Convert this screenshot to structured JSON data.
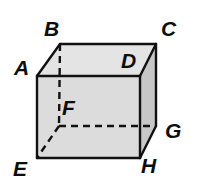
{
  "figure": {
    "kind": "geometry-diagram",
    "shape_name": "cube",
    "background_color": "#ffffff",
    "stroke_color": "#111111",
    "label_color": "#0d0d0d"
  },
  "faces": {
    "front": {
      "name": "front-face",
      "fill": "#dcdcdc",
      "vertices": "A D H E"
    },
    "top": {
      "name": "top-face",
      "fill": "#e4e4e4",
      "vertices": "B C D A"
    },
    "right": {
      "name": "right-face",
      "fill": "#c7c7c7",
      "vertices": "D C G H"
    }
  },
  "vertices": [
    {
      "id": "A",
      "label": "A",
      "x": 37,
      "y": 76,
      "hidden": false,
      "label_x": 14,
      "label_y": 57
    },
    {
      "id": "B",
      "label": "B",
      "x": 60,
      "y": 44,
      "hidden": false,
      "label_x": 44,
      "label_y": 18
    },
    {
      "id": "C",
      "label": "C",
      "x": 156,
      "y": 44,
      "hidden": false,
      "label_x": 161,
      "label_y": 18
    },
    {
      "id": "D",
      "label": "D",
      "x": 140,
      "y": 76,
      "hidden": false,
      "label_x": 121,
      "label_y": 50
    },
    {
      "id": "E",
      "label": "E",
      "x": 37,
      "y": 158,
      "hidden": false,
      "label_x": 13,
      "label_y": 158
    },
    {
      "id": "F",
      "label": "F",
      "x": 59,
      "y": 126,
      "hidden": true,
      "label_x": 62,
      "label_y": 97
    },
    {
      "id": "G",
      "label": "G",
      "x": 156,
      "y": 126,
      "hidden": false,
      "label_x": 165,
      "label_y": 120
    },
    {
      "id": "H",
      "label": "H",
      "x": 140,
      "y": 158,
      "hidden": false,
      "label_x": 141,
      "label_y": 155
    }
  ],
  "edges": {
    "solid": [
      {
        "name": "edge-A-B",
        "from": "A",
        "to": "B"
      },
      {
        "name": "edge-B-C",
        "from": "B",
        "to": "C"
      },
      {
        "name": "edge-C-D",
        "from": "C",
        "to": "D"
      },
      {
        "name": "edge-D-A",
        "from": "D",
        "to": "A"
      },
      {
        "name": "edge-A-E",
        "from": "A",
        "to": "E"
      },
      {
        "name": "edge-D-H",
        "from": "D",
        "to": "H"
      },
      {
        "name": "edge-C-G",
        "from": "C",
        "to": "G"
      },
      {
        "name": "edge-E-H",
        "from": "E",
        "to": "H"
      },
      {
        "name": "edge-H-G",
        "from": "H",
        "to": "G"
      }
    ],
    "dashed": [
      {
        "name": "edge-B-F",
        "from": "B",
        "to": "F"
      },
      {
        "name": "edge-F-E",
        "from": "F",
        "to": "E"
      },
      {
        "name": "edge-F-G",
        "from": "F",
        "to": "G"
      }
    ]
  },
  "style": {
    "stroke_width": 2.4,
    "dash_pattern": "7 5",
    "label_font_size_px": 21
  }
}
